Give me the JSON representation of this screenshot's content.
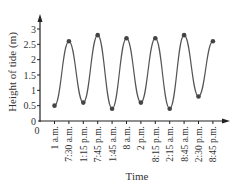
{
  "chart_data": {
    "type": "line",
    "title": "",
    "xlabel": "Time",
    "ylabel": "Height of tide (m)",
    "categories": [
      "1 a.m.",
      "7:30 a.m.",
      "1:15 p.m.",
      "7:45 p.m.",
      "1:45 a.m.",
      "8 a.m.",
      "2 p.m.",
      "8:15 p.m.",
      "2:15 a.m.",
      "8:45 a.m.",
      "2:30 p.m.",
      "8:45 p.m."
    ],
    "values": [
      0.5,
      2.6,
      0.6,
      2.8,
      0.4,
      2.7,
      0.6,
      2.7,
      0.4,
      2.8,
      0.8,
      2.6
    ],
    "ylim": [
      0,
      3
    ],
    "yticks": [
      0,
      0.5,
      1,
      1.5,
      2,
      2.5,
      3
    ],
    "ytick_labels": [
      "0",
      "0.5",
      "1",
      "1.5",
      "2",
      "2.5",
      "3"
    ],
    "origin_label": "0",
    "grid": false,
    "legend": null,
    "smooth": true,
    "colors": {
      "line": "#555555",
      "marker": "#444444",
      "axis": "#222222"
    }
  }
}
